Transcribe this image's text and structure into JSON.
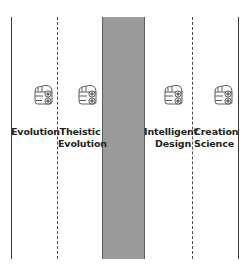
{
  "diagram": {
    "background_color": "#ffffff",
    "band": {
      "name": "central-divide-band",
      "color": "#9a9a9a",
      "border_color": "#5d5d5d"
    },
    "line_color": "#3a3a3a",
    "boundaries": [
      {
        "id": "left-outer-boundary",
        "style": "solid",
        "x": 11
      },
      {
        "id": "left-inner-boundary",
        "style": "dashed",
        "x": 57
      },
      {
        "id": "right-inner-boundary",
        "style": "dashed",
        "x": 192
      },
      {
        "id": "right-outer-boundary",
        "style": "solid",
        "x": 238
      }
    ],
    "categories": [
      {
        "id": "evolution",
        "label": "Evolution",
        "icon": "car-icon",
        "icon_x": 29,
        "label_x": 11,
        "label_width": 46,
        "align": "center"
      },
      {
        "id": "theistic-evolution",
        "label": "Theistic\nEvolution",
        "icon": "car-icon",
        "icon_x": 73,
        "label_x": 58,
        "label_width": 44,
        "align": "center"
      },
      {
        "id": "intelligent-design",
        "label": "Intelligent\nDesign",
        "icon": "car-icon",
        "icon_x": 159,
        "label_x": 144,
        "label_width": 47,
        "align": "right"
      },
      {
        "id": "creation-science",
        "label": "Creation\nScience",
        "icon": "car-icon",
        "icon_x": 209,
        "label_x": 194,
        "label_width": 44,
        "align": "left"
      }
    ]
  }
}
